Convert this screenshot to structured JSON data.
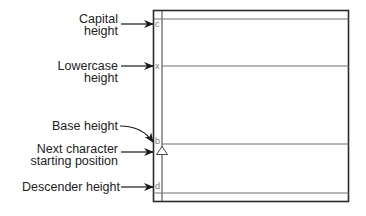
{
  "diagram": {
    "labels": {
      "capital": [
        "Capital",
        "height"
      ],
      "lowercase": [
        "Lowercase",
        "height"
      ],
      "base": [
        "Base height"
      ],
      "next_char": [
        "Next character",
        "starting position"
      ],
      "descender": [
        "Descender height"
      ]
    },
    "cell_glyphs": {
      "capital": "c",
      "lowercase": "x",
      "base": "b",
      "descender": "d"
    },
    "colors": {
      "frame": "#2a2a2a",
      "guide_lines": "#6e6e6e",
      "text": "#222222",
      "cell_glyph": "#777777"
    }
  }
}
